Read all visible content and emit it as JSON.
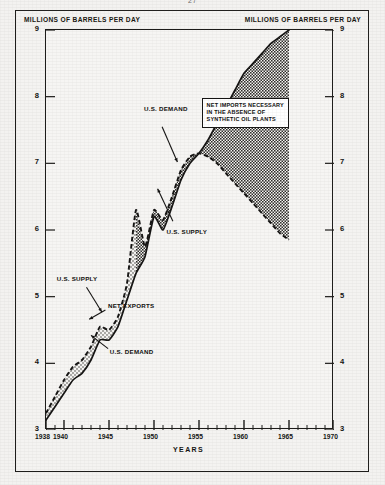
{
  "page": {
    "number": "27"
  },
  "captions": {
    "left_unit": "MILLIONS OF BARRELS PER DAY",
    "right_unit": "MILLIONS OF BARRELS PER DAY"
  },
  "chart_data": {
    "type": "area",
    "title": "",
    "subtitle": "",
    "xlabel": "YEARS",
    "ylabel": "MILLIONS OF BARRELS PER DAY",
    "ylabel_right": "MILLIONS OF BARRELS PER DAY",
    "xlim": [
      1938,
      1970
    ],
    "ylim": [
      3,
      9
    ],
    "grid": false,
    "legend_position": "none",
    "y_ticks": [
      3,
      4,
      5,
      6,
      7,
      8,
      9
    ],
    "y_ticks_right": [
      3,
      4,
      5,
      6,
      7,
      8,
      9
    ],
    "x_ticks_labeled": [
      1938,
      1940,
      1945,
      1950,
      1955,
      1960,
      1965,
      1970
    ],
    "x_ticks_minor_step": 1,
    "series": [
      {
        "name": "U.S. DEMAND",
        "style": "solid",
        "x": [
          1938,
          1939,
          1940,
          1941,
          1942,
          1943,
          1944,
          1945,
          1946,
          1947,
          1948,
          1949,
          1950,
          1951,
          1952,
          1953,
          1954,
          1955,
          1956,
          1957,
          1958,
          1959,
          1960,
          1961,
          1962,
          1963,
          1964,
          1965
        ],
        "values": [
          3.15,
          3.35,
          3.55,
          3.75,
          3.85,
          4.05,
          4.35,
          4.35,
          4.55,
          4.95,
          5.35,
          5.6,
          6.2,
          6.0,
          6.35,
          6.75,
          7.0,
          7.15,
          7.35,
          7.6,
          7.85,
          8.1,
          8.35,
          8.5,
          8.65,
          8.8,
          8.9,
          9.0
        ]
      },
      {
        "name": "U.S. SUPPLY",
        "style": "dashed",
        "x": [
          1938,
          1939,
          1940,
          1941,
          1942,
          1943,
          1944,
          1945,
          1946,
          1947,
          1948,
          1949,
          1950,
          1951,
          1952,
          1953,
          1954,
          1955,
          1956,
          1957,
          1958,
          1959,
          1960,
          1961,
          1962,
          1963,
          1964,
          1965
        ],
        "values": [
          3.25,
          3.5,
          3.75,
          3.95,
          4.05,
          4.25,
          4.55,
          4.5,
          4.7,
          5.2,
          6.3,
          5.75,
          6.3,
          6.15,
          6.5,
          6.9,
          7.1,
          7.15,
          7.1,
          7.0,
          6.85,
          6.7,
          6.55,
          6.4,
          6.25,
          6.1,
          5.95,
          5.85
        ]
      }
    ],
    "bands": [
      {
        "name": "NET EXPORTS",
        "fill": "stipple-light",
        "x_range": [
          1938,
          1948
        ],
        "description": "U.S. supply above U.S. demand"
      },
      {
        "name": "NET IMPORTS NECESSARY IN THE ABSENCE OF SYNTHETIC OIL PLANTS",
        "fill": "stipple-dark",
        "x_range": [
          1948,
          1965
        ],
        "description": "U.S. demand above U.S. supply"
      }
    ],
    "annotations": [
      {
        "id": "us-demand-upper",
        "text": "U.S. DEMAND",
        "x": 1949.0,
        "y": 7.8
      },
      {
        "id": "us-supply-mid",
        "text": "U.S. SUPPLY",
        "x": 1951.5,
        "y": 5.95
      },
      {
        "id": "us-supply-lower",
        "text": "U.S. SUPPLY",
        "x": 1939.3,
        "y": 5.25
      },
      {
        "id": "net-exports",
        "text": "NET EXPORTS",
        "x": 1945.0,
        "y": 4.85
      },
      {
        "id": "us-demand-lower",
        "text": "U.S. DEMAND",
        "x": 1945.2,
        "y": 4.15
      }
    ],
    "callout": {
      "lines": [
        "NET IMPORTS NECESSARY",
        "IN THE ABSENCE OF",
        "SYNTHETIC OIL PLANTS"
      ]
    },
    "colors": {
      "line": "#141312",
      "stipple_dark": "#4a4844",
      "stipple_light": "#8f8c85",
      "frame": "#1b1a18",
      "background": "#f6f5f3"
    }
  }
}
